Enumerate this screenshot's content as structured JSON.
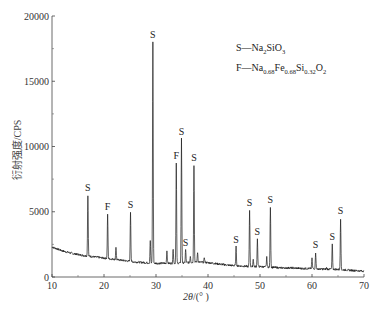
{
  "chart_data": {
    "type": "line",
    "title": "",
    "xlabel": "2θ/(°)",
    "ylabel": "衍射强度/CPS",
    "xlim": [
      10,
      70
    ],
    "ylim": [
      0,
      20000
    ],
    "x_ticks": [
      10,
      20,
      30,
      40,
      50,
      60,
      70
    ],
    "y_ticks": [
      0,
      5000,
      10000,
      15000,
      20000
    ],
    "grid": false,
    "legend": [
      {
        "symbol": "S",
        "phase": "Na2SiO3"
      },
      {
        "symbol": "F",
        "phase": "Na0.68Fe0.68Si0.32O2"
      }
    ],
    "background": [
      [
        10,
        2300
      ],
      [
        12,
        2000
      ],
      [
        14,
        1800
      ],
      [
        16,
        1650
      ],
      [
        18,
        1550
      ],
      [
        20,
        1450
      ],
      [
        22,
        1350
      ],
      [
        24,
        1250
      ],
      [
        26,
        1150
      ],
      [
        28,
        1100
      ],
      [
        30,
        1050
      ],
      [
        32,
        1050
      ],
      [
        34,
        1050
      ],
      [
        36,
        1100
      ],
      [
        38,
        1150
      ],
      [
        40,
        1100
      ],
      [
        42,
        1000
      ],
      [
        44,
        900
      ],
      [
        46,
        850
      ],
      [
        48,
        800
      ],
      [
        50,
        800
      ],
      [
        52,
        750
      ],
      [
        54,
        700
      ],
      [
        56,
        700
      ],
      [
        58,
        650
      ],
      [
        60,
        650
      ],
      [
        62,
        600
      ],
      [
        64,
        600
      ],
      [
        66,
        550
      ],
      [
        68,
        500
      ],
      [
        70,
        450
      ]
    ],
    "peaks": [
      {
        "x": 16.9,
        "y": 6300,
        "label": "S"
      },
      {
        "x": 20.7,
        "y": 4800,
        "label": "F"
      },
      {
        "x": 22.3,
        "y": 2300,
        "label": ""
      },
      {
        "x": 25.1,
        "y": 5000,
        "label": "S"
      },
      {
        "x": 28.9,
        "y": 2800,
        "label": ""
      },
      {
        "x": 29.4,
        "y": 18000,
        "label": "S"
      },
      {
        "x": 32.1,
        "y": 2000,
        "label": ""
      },
      {
        "x": 33.3,
        "y": 2200,
        "label": ""
      },
      {
        "x": 33.9,
        "y": 8700,
        "label": "F"
      },
      {
        "x": 34.9,
        "y": 10600,
        "label": "S"
      },
      {
        "x": 35.7,
        "y": 2100,
        "label": "S"
      },
      {
        "x": 36.6,
        "y": 1600,
        "label": ""
      },
      {
        "x": 37.3,
        "y": 8600,
        "label": "S"
      },
      {
        "x": 38.0,
        "y": 1900,
        "label": ""
      },
      {
        "x": 39.3,
        "y": 1500,
        "label": ""
      },
      {
        "x": 45.4,
        "y": 2300,
        "label": "S"
      },
      {
        "x": 48.0,
        "y": 5100,
        "label": "S"
      },
      {
        "x": 48.7,
        "y": 1400,
        "label": ""
      },
      {
        "x": 49.5,
        "y": 2900,
        "label": "S"
      },
      {
        "x": 51.3,
        "y": 1500,
        "label": ""
      },
      {
        "x": 52.0,
        "y": 5400,
        "label": "S"
      },
      {
        "x": 60.0,
        "y": 1400,
        "label": ""
      },
      {
        "x": 60.7,
        "y": 1900,
        "label": "S"
      },
      {
        "x": 62.8,
        "y": 700,
        "label": ""
      },
      {
        "x": 63.9,
        "y": 2500,
        "label": "S"
      },
      {
        "x": 65.5,
        "y": 4500,
        "label": "S"
      }
    ]
  },
  "legend_text": {
    "s_prefix": "S—Na",
    "s_sub1": "2",
    "s_mid": "SiO",
    "s_sub2": "3",
    "f_prefix": "F—Na",
    "f_sub1": "0.68",
    "f_mid1": "Fe",
    "f_sub2": "0.68",
    "f_mid2": "Si",
    "f_sub3": "0.32",
    "f_mid3": "O",
    "f_sub4": "2"
  },
  "axes": {
    "ylabel": "衍射强度/CPS",
    "xlabel_var": "2θ",
    "xlabel_unit": "/(° )"
  }
}
